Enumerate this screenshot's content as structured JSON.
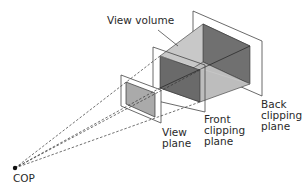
{
  "diagram": {
    "type": "perspective view volume",
    "labels": {
      "view_volume": "View volume",
      "view_plane": "View\nplane",
      "front_clipping_plane": "Front\nclipping\nplane",
      "back_clipping_plane": "Back\nclipping\nplane",
      "cop": "COP"
    },
    "colors": {
      "background": "#ffffff",
      "line": "#333333",
      "face_light": "#c6c6c6",
      "face_mid": "#b8b8b8",
      "face_dark": "#6e6e6e",
      "view_window": "#aaaaaa"
    }
  }
}
